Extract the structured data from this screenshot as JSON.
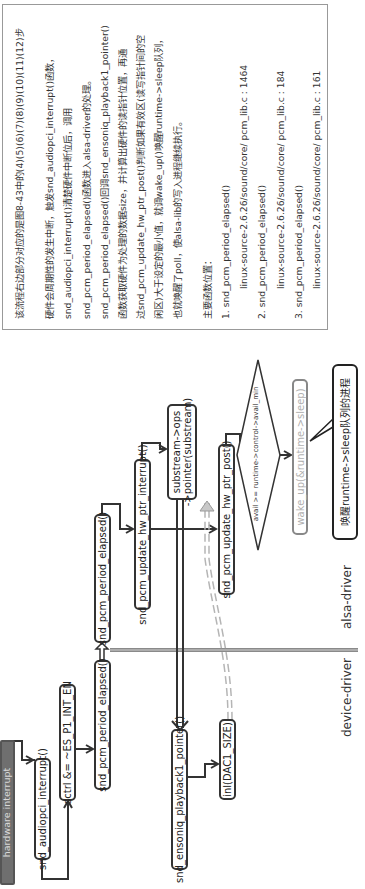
{
  "description": {
    "lines": [
      "该流程右边部分对应的是图8-43中的(4)(5)(6)(7)(8)(9)(10)(11)(12)步",
      "硬件会周期性的发生中断，触发snd_audiopci_interrupt()函数，",
      "snd_audiopci_interrupt()清楚硬件中断位后，调用",
      "snd_pcm_period_elapsed()函数进入alsa-driver的处理。",
      "snd_pcm_period_elapsed()回调snd_ensoniq_playback1_pointer()",
      "函数获取硬件为处理的数据size，并计算出硬件的读指针位置，再通",
      "过snd_pcm_update_hw_ptr_post()判断如果有效区(读写指针间的空",
      "闲区)大于设定的最小值，就调wake_up()唤醒runtime->sleep队列，",
      "也就唤醒了poll，使alsa-lib的写入进程继续执行。"
    ],
    "functions_title": "主要函数位置：",
    "functions": [
      {
        "name": "1. snd_pcm_period_elapsed()",
        "location": "linux-source-2.6.26/sound/core/ pcm_lib.c : 1464"
      },
      {
        "name": "2. snd_pcm_period_elapsed()",
        "location": "linux-source-2.6.26/sound/core/ pcm_lib.c : 184"
      },
      {
        "name": "3. snd_pcm_period_elapsed()",
        "location": "linux-source-2.6.26/sound/core/ pcm_lib.c : 161"
      }
    ]
  },
  "lanes": {
    "upper": "alsa-driver",
    "lower": "device-driver"
  },
  "nodes": {
    "hardware_interrupt": "hardware interrupt",
    "audiopci_interrupt": "snd_audiopci_interrupt()",
    "sctrl": "sctrl &= ~ES_P1_INT_EN",
    "period_elapsed_device": "snd_pcm_period_elapsed()",
    "period_elapsed_alsa": "snd_pcm_period_elapsed()",
    "update_hw_ptr_interrupt": "snd_pcm_update_hw_ptr_interrupt()",
    "ops_pointer_line1": "substream->ops",
    "ops_pointer_line2": "->pointer(substream)",
    "update_hw_ptr_post": "snd_pcm_update_hw_ptr_post()",
    "avail_condition": "avail >= runtime->control->avail_min",
    "wake_up": "wake_up(&runtime->sleep)",
    "wake_callout": "唤醒runtime->sleep队列的进程",
    "ensoniq_pointer": "snd_ensoniq_playback1_pointer()",
    "inl": "inl(DAC1_SIZE)"
  },
  "colors": {
    "line": "#333333",
    "divider": "#8a8a8a",
    "dashed": "#b5b5b5",
    "hw_box": "#6f6f6f",
    "muted_text": "#b0b0b0"
  }
}
